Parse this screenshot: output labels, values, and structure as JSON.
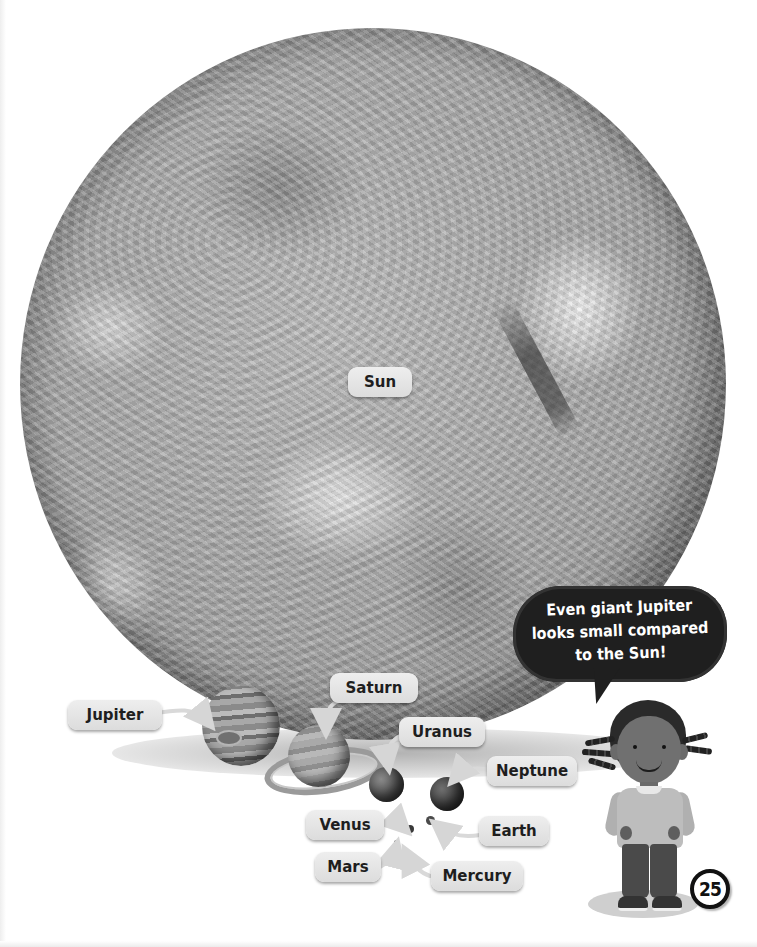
{
  "page": {
    "page_number": "25",
    "theme": "grayscale"
  },
  "speech_bubble": {
    "lines": [
      "Even giant Jupiter",
      "looks small compared",
      "to the Sun!"
    ]
  },
  "labels": {
    "sun": "Sun",
    "jupiter": "Jupiter",
    "saturn": "Saturn",
    "uranus": "Uranus",
    "neptune": "Neptune",
    "venus": "Venus",
    "earth": "Earth",
    "mars": "Mars",
    "mercury": "Mercury"
  },
  "colors": {
    "label_background": "#e4e4e4",
    "label_text": "#1e1e1e",
    "bubble_background": "#1f1f1f",
    "bubble_text": "#ffffff",
    "page_background": "#ffffff"
  }
}
